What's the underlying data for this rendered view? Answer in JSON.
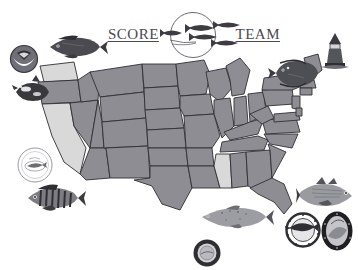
{
  "page": {
    "title": "SCORE TEAM",
    "background_color": "#ffffff",
    "width": 358,
    "height": 270
  },
  "logo": {
    "word_left": "SCORE",
    "word_right": "TEAM",
    "text_color": "#4a4a52",
    "circle_stroke": "#6b6b72",
    "fish_count": 5,
    "icon_name": "fish-school-logo"
  },
  "map": {
    "name": "united-states-map",
    "outline_color": "#2f2f33",
    "default_fill": "#8d8d93",
    "highlight_fill": "#d9d9d9",
    "ocean_fill": "#ffffff",
    "legend_note": "",
    "states": [
      {
        "code": "WA",
        "name": "Washington",
        "shade": "light"
      },
      {
        "code": "OR",
        "name": "Oregon",
        "shade": "dark"
      },
      {
        "code": "CA",
        "name": "California",
        "shade": "light"
      },
      {
        "code": "NV",
        "name": "Nevada",
        "shade": "dark"
      },
      {
        "code": "ID",
        "name": "Idaho",
        "shade": "dark"
      },
      {
        "code": "MT",
        "name": "Montana",
        "shade": "dark"
      },
      {
        "code": "WY",
        "name": "Wyoming",
        "shade": "dark"
      },
      {
        "code": "UT",
        "name": "Utah",
        "shade": "dark"
      },
      {
        "code": "AZ",
        "name": "Arizona",
        "shade": "dark"
      },
      {
        "code": "CO",
        "name": "Colorado",
        "shade": "dark"
      },
      {
        "code": "NM",
        "name": "New Mexico",
        "shade": "dark"
      },
      {
        "code": "ND",
        "name": "North Dakota",
        "shade": "dark"
      },
      {
        "code": "SD",
        "name": "South Dakota",
        "shade": "dark"
      },
      {
        "code": "NE",
        "name": "Nebraska",
        "shade": "dark"
      },
      {
        "code": "KS",
        "name": "Kansas",
        "shade": "dark"
      },
      {
        "code": "OK",
        "name": "Oklahoma",
        "shade": "dark"
      },
      {
        "code": "TX",
        "name": "Texas",
        "shade": "dark"
      },
      {
        "code": "MN",
        "name": "Minnesota",
        "shade": "dark"
      },
      {
        "code": "IA",
        "name": "Iowa",
        "shade": "dark"
      },
      {
        "code": "MO",
        "name": "Missouri",
        "shade": "dark"
      },
      {
        "code": "AR",
        "name": "Arkansas",
        "shade": "dark"
      },
      {
        "code": "LA",
        "name": "Louisiana",
        "shade": "dark"
      },
      {
        "code": "WI",
        "name": "Wisconsin",
        "shade": "dark"
      },
      {
        "code": "IL",
        "name": "Illinois",
        "shade": "dark"
      },
      {
        "code": "MI",
        "name": "Michigan",
        "shade": "dark"
      },
      {
        "code": "IN",
        "name": "Indiana",
        "shade": "dark"
      },
      {
        "code": "OH",
        "name": "Ohio",
        "shade": "dark"
      },
      {
        "code": "KY",
        "name": "Kentucky",
        "shade": "dark"
      },
      {
        "code": "TN",
        "name": "Tennessee",
        "shade": "dark"
      },
      {
        "code": "MS",
        "name": "Mississippi",
        "shade": "light"
      },
      {
        "code": "AL",
        "name": "Alabama",
        "shade": "dark"
      },
      {
        "code": "GA",
        "name": "Georgia",
        "shade": "dark"
      },
      {
        "code": "FL",
        "name": "Florida",
        "shade": "dark"
      },
      {
        "code": "SC",
        "name": "South Carolina",
        "shade": "dark"
      },
      {
        "code": "NC",
        "name": "North Carolina",
        "shade": "dark"
      },
      {
        "code": "VA",
        "name": "Virginia",
        "shade": "dark"
      },
      {
        "code": "WV",
        "name": "West Virginia",
        "shade": "dark"
      },
      {
        "code": "MD",
        "name": "Maryland",
        "shade": "dark"
      },
      {
        "code": "PA",
        "name": "Pennsylvania",
        "shade": "dark"
      },
      {
        "code": "NY",
        "name": "New York",
        "shade": "dark"
      },
      {
        "code": "VT",
        "name": "Vermont",
        "shade": "dark"
      },
      {
        "code": "NH",
        "name": "New Hampshire",
        "shade": "dark"
      },
      {
        "code": "ME",
        "name": "Maine",
        "shade": "dark"
      },
      {
        "code": "MA",
        "name": "Massachusetts",
        "shade": "dark"
      },
      {
        "code": "CT",
        "name": "Connecticut",
        "shade": "dark"
      },
      {
        "code": "NJ",
        "name": "New Jersey",
        "shade": "dark"
      },
      {
        "code": "DE",
        "name": "Delaware",
        "shade": "dark"
      }
    ]
  },
  "artwork": {
    "noaa_logo": {
      "name": "noaa-seal-icon",
      "label": "NOAA",
      "position": "top-left"
    },
    "orca": {
      "name": "orca-whale-illustration",
      "label": "Orca",
      "position": "upper-left"
    },
    "sea_bass": {
      "name": "sea-bass-illustration",
      "label": "Black Sea Bass",
      "position": "top-left"
    },
    "flatfish": {
      "name": "flounder-illustration",
      "label": "Flounder",
      "position": "top-right"
    },
    "lighthouse": {
      "name": "lighthouse-illustration",
      "label": "Lighthouse",
      "position": "top-right-corner"
    },
    "yellow_perch": {
      "name": "yellow-perch-illustration",
      "label": "Yellow Perch",
      "position": "lower-left"
    },
    "striped_bass": {
      "name": "striped-bass-illustration",
      "label": "Striped Bass",
      "position": "lower-right"
    },
    "salmon": {
      "name": "salmon-illustration",
      "label": "Salmon",
      "position": "bottom-center"
    },
    "research_seal": {
      "name": "research-institute-seal-icon",
      "label": "Marine Research Seal",
      "position": "left"
    },
    "billfish_seal": {
      "name": "billfish-seal-icon",
      "label": "Billfish Seal",
      "position": "bottom-right"
    },
    "oval_seal": {
      "name": "oval-agency-seal-icon",
      "label": "Agency Seal",
      "position": "bottom-right-corner"
    },
    "ring_seal": {
      "name": "ring-seal-icon",
      "label": "Program Seal",
      "position": "bottom-center"
    }
  },
  "colors": {
    "ink": "#2f2f33",
    "state_dark": "#8d8d93",
    "state_light": "#d9d9d9",
    "art_gray": "#5d5d63",
    "art_dark": "#3a3a3f"
  }
}
